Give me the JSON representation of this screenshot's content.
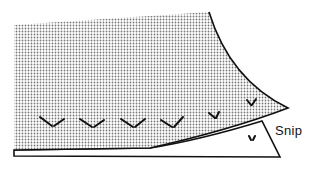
{
  "diagram": {
    "labels": {
      "snip": "Snip"
    },
    "colors": {
      "fabric_fill": "#bdbdbd",
      "line": "#111111",
      "background": "#ffffff"
    },
    "snip_marks_count": 7
  }
}
